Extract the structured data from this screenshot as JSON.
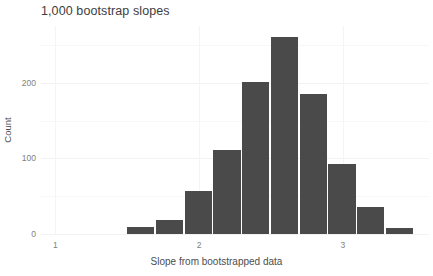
{
  "chart_data": {
    "type": "bar",
    "title": "1,000 bootstrap slopes",
    "subtitle": "",
    "xlabel": "Slope from bootstrapped data",
    "ylabel": "Count",
    "xlim": [
      0.9,
      3.6
    ],
    "ylim": [
      0,
      275
    ],
    "xticks": [
      "1",
      "2",
      "3"
    ],
    "xtick_values": [
      1,
      2,
      3
    ],
    "yticks": [
      "0",
      "100",
      "200"
    ],
    "ytick_values": [
      0,
      100,
      200
    ],
    "grid": true,
    "legend": null,
    "bin_width": 0.2,
    "bin_edges": [
      1.5,
      1.7,
      1.9,
      2.1,
      2.3,
      2.5,
      2.7,
      2.9,
      3.1,
      3.3,
      3.5
    ],
    "categories": [
      "1.5-1.7",
      "1.7-1.9",
      "1.9-2.1",
      "2.1-2.3",
      "2.3-2.5",
      "2.5-2.7",
      "2.7-2.9",
      "2.9-3.1",
      "3.1-3.3",
      "3.3-3.5"
    ],
    "bars": [
      {
        "label": "1.5-1.7",
        "x0": 1.5,
        "x1": 1.7,
        "value": 9
      },
      {
        "label": "1.7-1.9",
        "x0": 1.7,
        "x1": 1.9,
        "value": 18
      },
      {
        "label": "1.9-2.1",
        "x0": 1.9,
        "x1": 2.1,
        "value": 57
      },
      {
        "label": "2.1-2.3",
        "x0": 2.1,
        "x1": 2.3,
        "value": 111
      },
      {
        "label": "2.3-2.5",
        "x0": 2.3,
        "x1": 2.5,
        "value": 201
      },
      {
        "label": "2.5-2.7",
        "x0": 2.5,
        "x1": 2.7,
        "value": 260
      },
      {
        "label": "2.7-2.9",
        "x0": 2.7,
        "x1": 2.9,
        "value": 185
      },
      {
        "label": "2.9-3.1",
        "x0": 2.9,
        "x1": 3.1,
        "value": 92
      },
      {
        "label": "3.1-3.3",
        "x0": 3.1,
        "x1": 3.3,
        "value": 36
      },
      {
        "label": "3.3-3.5",
        "x0": 3.3,
        "x1": 3.5,
        "value": 8
      }
    ],
    "values": [
      9,
      18,
      57,
      111,
      201,
      260,
      185,
      92,
      36,
      8
    ],
    "colors": {
      "bar_fill": "#4a4a4a",
      "background": "#ffffff",
      "gridline": "#f2f2f2",
      "tick_label": "#808080",
      "axis_title": "#4d4d4d",
      "title": "#3d3d3d"
    }
  }
}
